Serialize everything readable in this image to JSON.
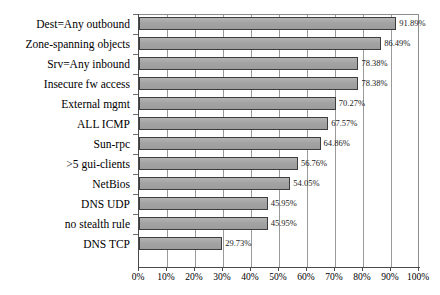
{
  "chart_data": {
    "type": "bar",
    "orientation": "horizontal",
    "title": "",
    "subtitle": "",
    "xlabel": "",
    "ylabel": "",
    "xlim": [
      0,
      100
    ],
    "grid": true,
    "legend": null,
    "legend_position": "none",
    "x_tick_labels": [
      "0%",
      "10%",
      "20%",
      "30%",
      "40%",
      "50%",
      "60%",
      "70%",
      "80%",
      "90%",
      "100%"
    ],
    "x_tick_values": [
      0,
      10,
      20,
      30,
      40,
      50,
      60,
      70,
      80,
      90,
      100
    ],
    "categories": [
      "Dest=Any outbound",
      "Zone-spanning objects",
      "Srv=Any inbound",
      "Insecure fw access",
      "External mgmt",
      "ALL ICMP",
      "Sun-rpc",
      ">5 gui-clients",
      "NetBios",
      "DNS UDP",
      "no stealth rule",
      "DNS TCP"
    ],
    "values": [
      91.89,
      86.49,
      78.38,
      78.38,
      70.27,
      67.57,
      64.86,
      56.76,
      54.05,
      45.95,
      45.95,
      29.73
    ],
    "data_labels": [
      "91.89%",
      "86.49%",
      "78.38%",
      "78.38%",
      "70.27%",
      "67.57%",
      "64.86%",
      "56.76%",
      "54.05%",
      "45.95%",
      "45.95%",
      "29.73%"
    ],
    "colors": {
      "bar_fill": "#a6a6a6",
      "bar_border": "#3d3d3d",
      "gridline": "#9a9a9a",
      "axis": "#4a4a4a",
      "background": "#ffffff",
      "text": "#000000"
    }
  }
}
